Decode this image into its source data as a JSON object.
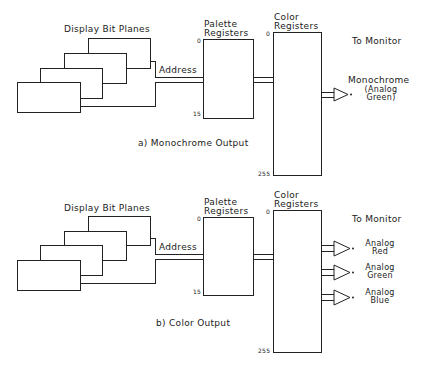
{
  "panels": [
    {
      "bit_planes_label": "Display Bit Planes",
      "address_label": "Address",
      "palette_label_1": "Palette",
      "palette_label_2": "Registers",
      "palette_top": "0",
      "palette_bottom": "15",
      "color_label_1": "Color",
      "color_label_2": "Registers",
      "color_top": "0",
      "color_bottom": "255",
      "monitor_label": "To Monitor",
      "outputs": [
        {
          "line1": "Monochrome",
          "line2": "(Analog",
          "line3": "Green)"
        }
      ],
      "caption": "a) Monochrome Output"
    },
    {
      "bit_planes_label": "Display Bit Planes",
      "address_label": "Address",
      "palette_label_1": "Palette",
      "palette_label_2": "Registers",
      "palette_top": "0",
      "palette_bottom": "15",
      "color_label_1": "Color",
      "color_label_2": "Registers",
      "color_top": "0",
      "color_bottom": "255",
      "monitor_label": "To Monitor",
      "outputs": [
        {
          "line1": "Analog",
          "line2": "Red"
        },
        {
          "line1": "Analog",
          "line2": "Green"
        },
        {
          "line1": "Analog",
          "line2": "Blue"
        }
      ],
      "caption": "b) Color Output"
    }
  ]
}
